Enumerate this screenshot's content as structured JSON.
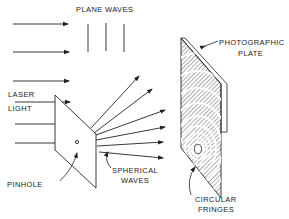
{
  "diagram": {
    "labels": {
      "plane_waves": "PLANE WAVES",
      "laser_light": [
        "LASER",
        "LIGHT"
      ],
      "pinhole": "PINHOLE",
      "spherical_waves": [
        "SPHERICAL",
        "WAVES"
      ],
      "photographic_plate": [
        "PHOTOGRAPHIC",
        "PLATE"
      ],
      "circular_fringes": [
        "CIRCULAR",
        "FRINGES"
      ]
    },
    "colors": {
      "line": "#222222",
      "background": "#ffffff"
    },
    "elements": {
      "incoming_arrows": 6,
      "plane_wavefronts": 3,
      "spherical_rays": 6
    }
  }
}
